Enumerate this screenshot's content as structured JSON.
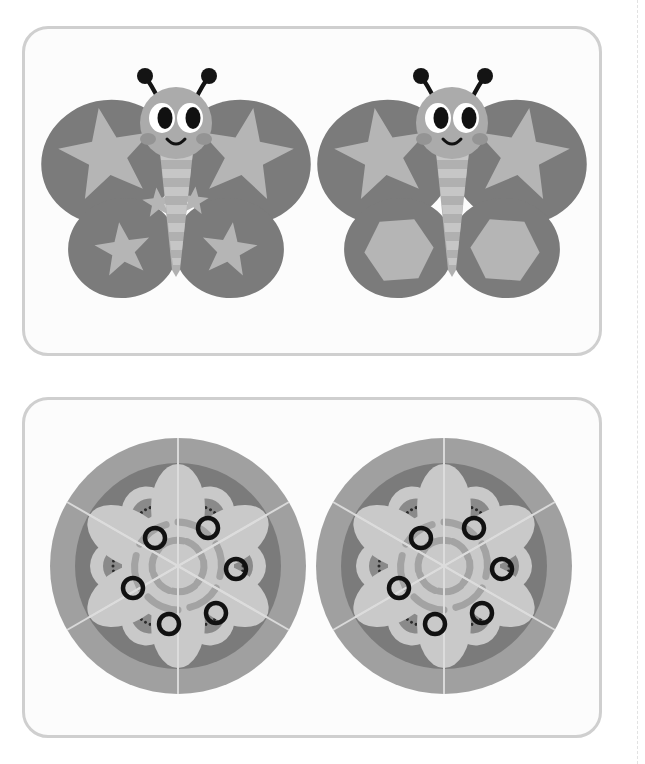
{
  "page": {
    "width": 645,
    "height": 764,
    "background": "#ffffff",
    "cut_guide": {
      "style": "dashed-vertical",
      "color": "#e2e2e2"
    }
  },
  "palette": {
    "panel_border": "#cfcfcf",
    "panel_fill": "#fcfcfc",
    "wing_dark": "#7b7b7b",
    "shape_light": "#b5b5b5",
    "body_light": "#b0b0b0",
    "body_stripe": "#c6c6c6",
    "head_fill": "#ababab",
    "cheek": "#949494",
    "eye_black": "#111111",
    "antenna_black": "#141414",
    "mandala_outer_ring": "#a0a0a0",
    "mandala_disc": "#7b7b7b",
    "petal_light": "#c9c9c9",
    "petal_mid": "#bdbdbd",
    "arc_stroke": "#a3a3a3",
    "seed_half": "#8a8a8a",
    "seed_dot": "#2b2b2b",
    "ring_outline": "#111111",
    "radial_line": "#dddddd"
  },
  "panels": [
    {
      "id": "panel-butterflies",
      "name": "butterflies-panel",
      "figures": [
        {
          "id": "butterfly-left",
          "name": "butterfly-left",
          "upper_wing_shape": "star",
          "lower_wing_shape": "star",
          "small_star_accents": true,
          "antennae": 2,
          "body_stripes": 7
        },
        {
          "id": "butterfly-right",
          "name": "butterfly-right",
          "upper_wing_shape": "star",
          "lower_wing_shape": "hexagon",
          "small_star_accents": false,
          "antennae": 2,
          "body_stripes": 7
        }
      ]
    },
    {
      "id": "panel-mandalas",
      "name": "mandalas-panel",
      "figures": [
        {
          "id": "mandala-left",
          "name": "mandala-left",
          "segments": 6,
          "large_petals": 6,
          "seed_petals": 6,
          "ring_circles": 6,
          "arc_strokes": 6
        },
        {
          "id": "mandala-right",
          "name": "mandala-right",
          "segments": 6,
          "large_petals": 6,
          "seed_petals": 6,
          "ring_circles": 6,
          "arc_strokes": 6
        }
      ]
    }
  ]
}
